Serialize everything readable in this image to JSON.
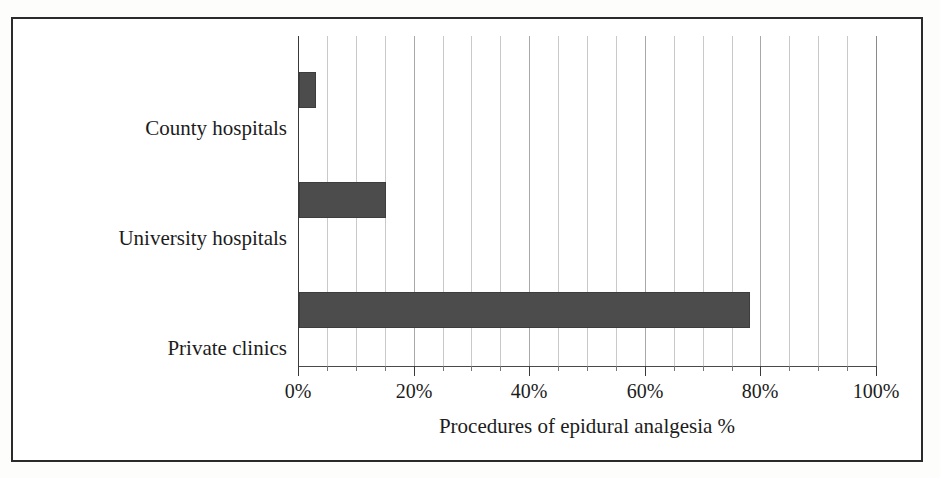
{
  "chart_data": {
    "type": "bar",
    "orientation": "horizontal",
    "title": "",
    "xlabel": "Procedures of epidural analgesia %",
    "ylabel": "Obstetrics-gynaecology clinics",
    "categories": [
      "County hospitals",
      "University hospitals",
      "Private clinics"
    ],
    "values": [
      3,
      15,
      78
    ],
    "series": [
      {
        "name": "Procedures of epidural analgesia %",
        "values": [
          3,
          15,
          78
        ]
      }
    ],
    "xlim": [
      0,
      100
    ],
    "xticks": [
      0,
      20,
      40,
      60,
      80,
      100
    ],
    "xticklabels": [
      "0%",
      "20%",
      "40%",
      "60%",
      "80%",
      "100%"
    ],
    "minor_tick_step": 5,
    "grid": true,
    "grid_axis": "x",
    "legend": false,
    "legend_position": "none",
    "bar_color": "#4c4c4c",
    "background_color": "#ffffff",
    "frame_color": "#2b2b2b"
  },
  "axes": {
    "x_title": "Procedures of epidural analgesia %",
    "y_title": "Obstetrics-gynaecology clinics",
    "x_tick_labels": [
      "0%",
      "20%",
      "40%",
      "60%",
      "80%",
      "100%"
    ],
    "category_labels": [
      "County hospitals",
      "University hospitals",
      "Private clinics"
    ]
  }
}
